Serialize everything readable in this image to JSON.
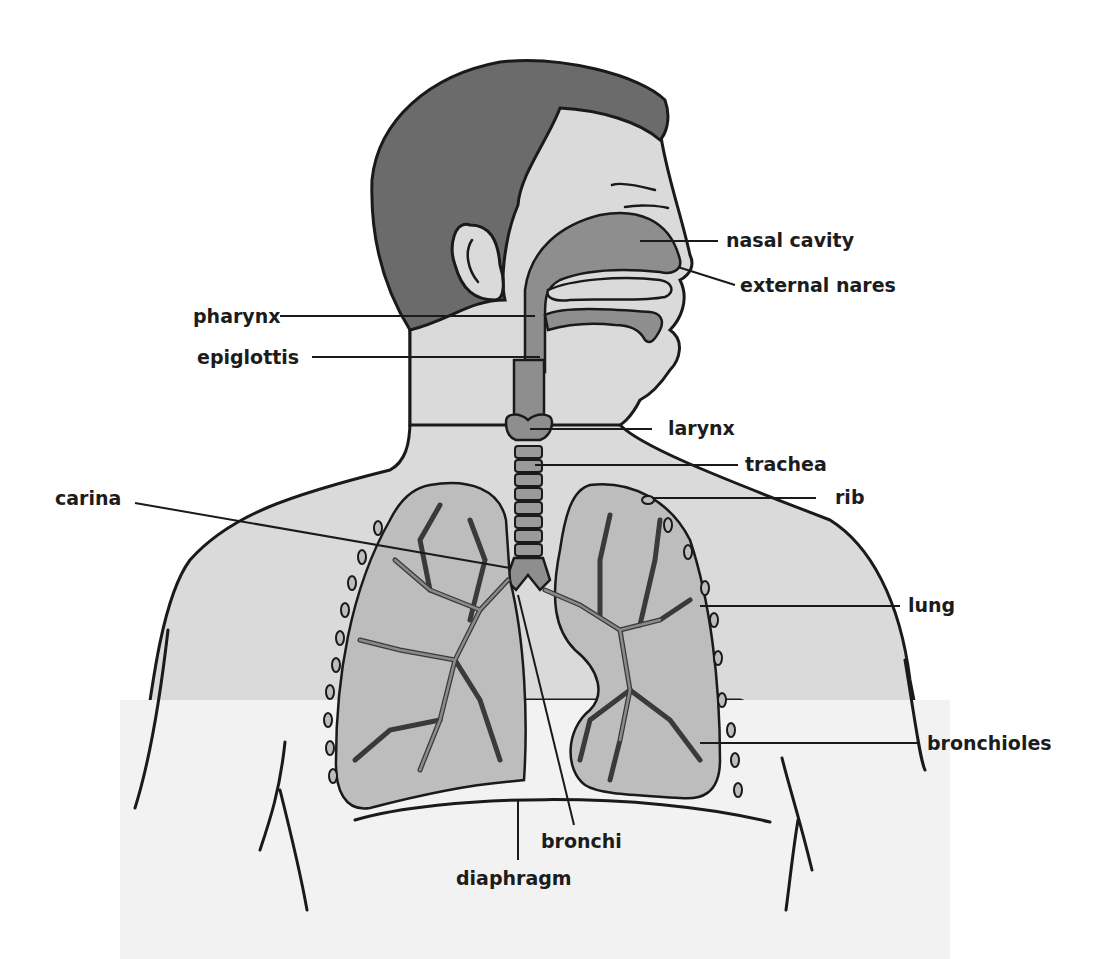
{
  "diagram": {
    "colors": {
      "background": "#ffffff",
      "skin": "#dadada",
      "hair": "#6b6b6b",
      "airway": "#8e8e8e",
      "lung": "#bdbdbd",
      "outline": "#1a1a1a",
      "label_text": "#1c1c1c"
    },
    "labels": {
      "nasal_cavity": "nasal cavity",
      "external_nares": "external nares",
      "pharynx": "pharynx",
      "epiglottis": "epiglottis",
      "larynx": "larynx",
      "trachea": "trachea",
      "rib": "rib",
      "carina": "carina",
      "lung": "lung",
      "bronchioles": "bronchioles",
      "bronchi": "bronchi",
      "diaphragm": "diaphragm"
    }
  }
}
